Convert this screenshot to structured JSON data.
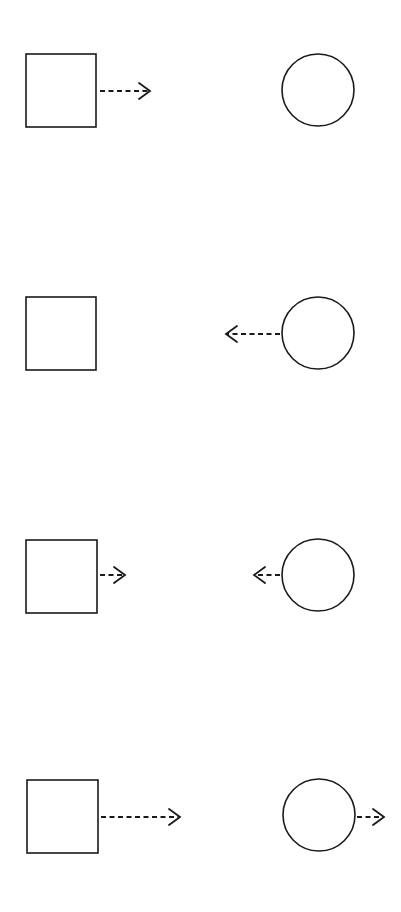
{
  "diagram": {
    "stroke_color": "#1a1a1a",
    "background": "#ffffff",
    "rows": [
      {
        "id": "row-1",
        "square": {
          "x": 26,
          "y": 54,
          "w": 70,
          "h": 73
        },
        "circle": {
          "cx": 318,
          "cy": 90,
          "r": 36
        },
        "arrows": [
          {
            "from": "square",
            "direction": "right",
            "x1": 100,
            "x2": 150,
            "y": 91
          }
        ]
      },
      {
        "id": "row-2",
        "square": {
          "x": 26,
          "y": 297,
          "w": 70,
          "h": 73
        },
        "circle": {
          "cx": 318,
          "cy": 333,
          "r": 36
        },
        "arrows": [
          {
            "from": "circle",
            "direction": "left",
            "x1": 280,
            "x2": 226,
            "y": 334
          }
        ]
      },
      {
        "id": "row-3",
        "square": {
          "x": 26,
          "y": 540,
          "w": 71,
          "h": 73
        },
        "circle": {
          "cx": 318,
          "cy": 575,
          "r": 36
        },
        "arrows": [
          {
            "from": "square",
            "direction": "right",
            "x1": 100,
            "x2": 125,
            "y": 575
          },
          {
            "from": "circle",
            "direction": "left",
            "x1": 280,
            "x2": 254,
            "y": 575
          }
        ]
      },
      {
        "id": "row-4",
        "square": {
          "x": 27,
          "y": 780,
          "w": 71,
          "h": 73
        },
        "circle": {
          "cx": 319,
          "cy": 815,
          "r": 36
        },
        "arrows": [
          {
            "from": "square",
            "direction": "right",
            "x1": 101,
            "x2": 180,
            "y": 817
          },
          {
            "from": "circle",
            "direction": "right",
            "x1": 357,
            "x2": 384,
            "y": 817
          }
        ]
      }
    ]
  }
}
